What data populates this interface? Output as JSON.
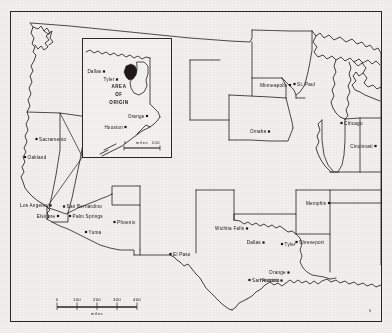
{
  "figure": {
    "type": "reference-map",
    "background_color": "#f2f1ed",
    "ink_color": "#231f1c"
  },
  "main_map": {
    "name": "united-states-outline-map",
    "cities": [
      {
        "id": "sacramento",
        "label": "Sacramento",
        "x": 36.5,
        "y": 139.0,
        "anchor": "right"
      },
      {
        "id": "oakland",
        "label": "Oakland",
        "x": 25.0,
        "y": 157.0,
        "anchor": "right"
      },
      {
        "id": "los-angeles",
        "label": "Los Angeles",
        "x": 50.5,
        "y": 205.5,
        "anchor": "left"
      },
      {
        "id": "san-bernardino",
        "label": "San Bernardino",
        "x": 64.0,
        "y": 206.5,
        "anchor": "right"
      },
      {
        "id": "elsinore",
        "label": "Elsinore",
        "x": 58.0,
        "y": 216.0,
        "anchor": "left"
      },
      {
        "id": "palm-springs",
        "label": "Palm Springs",
        "x": 70.0,
        "y": 216.0,
        "anchor": "right"
      },
      {
        "id": "yuma",
        "label": "Yuma",
        "x": 86.0,
        "y": 232.0,
        "anchor": "right"
      },
      {
        "id": "phoenix",
        "label": "Phoenix",
        "x": 114.5,
        "y": 222.0,
        "anchor": "right"
      },
      {
        "id": "el-paso",
        "label": "El Paso",
        "x": 170.5,
        "y": 254.0,
        "anchor": "right"
      },
      {
        "id": "wichita-falls",
        "label": "Wichita Falls",
        "x": 247.0,
        "y": 228.5,
        "anchor": "left"
      },
      {
        "id": "dallas",
        "label": "Dallas",
        "x": 263.5,
        "y": 242.5,
        "anchor": "left"
      },
      {
        "id": "tyler",
        "label": "Tyler",
        "x": 282.0,
        "y": 244.0,
        "anchor": "right"
      },
      {
        "id": "shreveport",
        "label": "Shreveport",
        "x": 296.5,
        "y": 242.0,
        "anchor": "right"
      },
      {
        "id": "orange",
        "label": "Orange",
        "x": 288.5,
        "y": 272.5,
        "anchor": "left"
      },
      {
        "id": "houston",
        "label": "Houston",
        "x": 281.5,
        "y": 280.5,
        "anchor": "left"
      },
      {
        "id": "san-antonio",
        "label": "San Antonio",
        "x": 249.5,
        "y": 280.0,
        "anchor": "right"
      },
      {
        "id": "memphis",
        "label": "Memphis",
        "x": 329.0,
        "y": 203.0,
        "anchor": "left"
      },
      {
        "id": "cincinnati",
        "label": "Cincinnati",
        "x": 375.5,
        "y": 146.0,
        "anchor": "left"
      },
      {
        "id": "chicago",
        "label": "Chicago",
        "x": 341.5,
        "y": 123.0,
        "anchor": "right"
      },
      {
        "id": "omaha",
        "label": "Omaha",
        "x": 269.0,
        "y": 131.5,
        "anchor": "left"
      },
      {
        "id": "minneapolis",
        "label": "Minneapolis",
        "x": 290.0,
        "y": 85.0,
        "anchor": "left"
      },
      {
        "id": "st-paul",
        "label": "St. Paul",
        "x": 294.5,
        "y": 84.0,
        "anchor": "right"
      }
    ]
  },
  "inset": {
    "name": "east-texas-inset",
    "origin_label_lines": [
      "AREA",
      "OF",
      "ORIGIN"
    ],
    "cities": [
      {
        "id": "inset-dallas",
        "label": "Dallas",
        "x": 104.0,
        "y": 71.5,
        "anchor": "left"
      },
      {
        "id": "inset-tyler",
        "label": "Tyler",
        "x": 117.0,
        "y": 79.5,
        "anchor": "left"
      },
      {
        "id": "inset-orange",
        "label": "Orange",
        "x": 147.0,
        "y": 116.0,
        "anchor": "left"
      },
      {
        "id": "inset-houston",
        "label": "Houston",
        "x": 125.5,
        "y": 127.0,
        "anchor": "left"
      }
    ],
    "scale": {
      "labels": [
        "0",
        "miles",
        "100"
      ]
    }
  },
  "scale_bar": {
    "name": "main-scale-bar",
    "ticks": [
      "0",
      "100",
      "200",
      "300",
      "400"
    ],
    "unit": "miles"
  },
  "corner_mark": {
    "text": "5"
  }
}
